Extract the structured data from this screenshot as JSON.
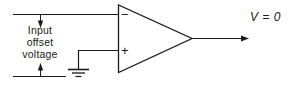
{
  "diagram": {
    "type": "schematic",
    "title_visible": false,
    "stroke_color": "#1a1a1a",
    "background_color": "#ffffff",
    "labels": {
      "offset_line1": "Input",
      "offset_line2": "offset",
      "offset_line3": "voltage",
      "output": "V = 0",
      "inverting_sign": "−",
      "noninverting_sign": "+"
    },
    "components": [
      {
        "name": "operational-amplifier",
        "shape": "triangle"
      },
      {
        "name": "ground-symbol",
        "bars": 3
      },
      {
        "name": "inverting-input-wire"
      },
      {
        "name": "noninverting-input-wire"
      },
      {
        "name": "output-wire"
      },
      {
        "name": "offset-dimension-arrows",
        "direction": "vertical-both"
      }
    ]
  }
}
